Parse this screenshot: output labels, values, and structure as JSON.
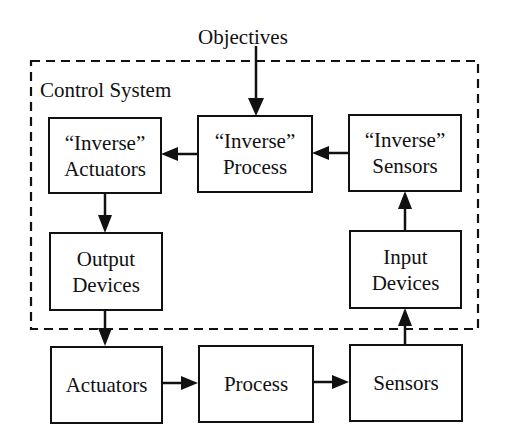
{
  "diagram": {
    "objectives_label": "Objectives",
    "control_system_label": "Control System",
    "nodes": {
      "inverse_actuators": {
        "line1": "“Inverse”",
        "line2": "Actuators"
      },
      "inverse_process": {
        "line1": "“Inverse”",
        "line2": "Process"
      },
      "inverse_sensors": {
        "line1": "“Inverse”",
        "line2": "Sensors"
      },
      "output_devices": {
        "line1": "Output",
        "line2": "Devices"
      },
      "input_devices": {
        "line1": "Input",
        "line2": "Devices"
      },
      "actuators": {
        "label": "Actuators"
      },
      "process": {
        "label": "Process"
      },
      "sensors": {
        "label": "Sensors"
      }
    },
    "edges": [
      {
        "from": "Objectives",
        "to": "“Inverse” Process"
      },
      {
        "from": "“Inverse” Sensors",
        "to": "“Inverse” Process"
      },
      {
        "from": "“Inverse” Process",
        "to": "“Inverse” Actuators"
      },
      {
        "from": "“Inverse” Actuators",
        "to": "Output Devices"
      },
      {
        "from": "Output Devices",
        "to": "Actuators"
      },
      {
        "from": "Actuators",
        "to": "Process"
      },
      {
        "from": "Process",
        "to": "Sensors"
      },
      {
        "from": "Sensors",
        "to": "Input Devices"
      },
      {
        "from": "Input Devices",
        "to": "“Inverse” Sensors"
      }
    ]
  }
}
